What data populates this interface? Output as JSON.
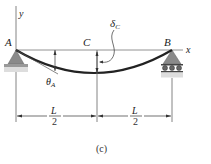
{
  "diagram": {
    "labels": {
      "point_a": "A",
      "point_b": "B",
      "point_c": "C",
      "axis_x": "x",
      "axis_y": "y",
      "delta": "δ",
      "delta_sub": "C",
      "theta": "θ",
      "theta_sub": "A",
      "span_left_num": "L",
      "span_left_den": "2",
      "span_right_num": "L",
      "span_right_den": "2",
      "caption": "(c)"
    },
    "colors": {
      "support_fill": "#8a8a8a",
      "ground_fill": "#c8c8c8",
      "beam": "#222222",
      "line": "#555555"
    }
  }
}
